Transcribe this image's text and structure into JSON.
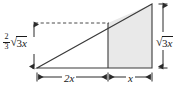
{
  "figure": {
    "colors": {
      "stroke": "#3a3a3a",
      "shade_fill": "#e9e9e9",
      "text": "#1a1a1a",
      "background": "#ffffff"
    },
    "labels": {
      "height_partial": {
        "numerator": "2",
        "denominator": "3",
        "radical_sign": "√",
        "radicand": "3",
        "variable": "x",
        "plain": "2/3 √3x"
      },
      "height_total": {
        "radical_sign": "√",
        "radicand": "3",
        "variable": "x",
        "plain": "√3x"
      },
      "base_left": "2x",
      "base_right": "x"
    },
    "geometry": {
      "triangle": {
        "left_vertex": [
          37,
          68
        ],
        "right_vertex": [
          152,
          68
        ],
        "apex": [
          152,
          4
        ]
      },
      "rectangle": {
        "x": 108,
        "y": 23,
        "width": 44,
        "height": 45
      },
      "dashed_line": {
        "x1": 35,
        "y1": 23,
        "x2": 108,
        "y2": 23
      },
      "dim_left": {
        "x": 34,
        "y1": 23,
        "y2": 68
      },
      "dim_right": {
        "x": 163,
        "y1": 4,
        "y2": 68
      },
      "dim_bottom_left": {
        "y": 77,
        "x1": 37,
        "x2": 108
      },
      "dim_bottom_right": {
        "y": 77,
        "x1": 108,
        "x2": 152
      }
    }
  }
}
